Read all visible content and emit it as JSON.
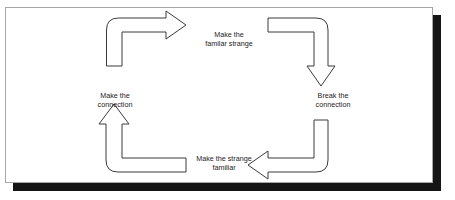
{
  "figure": {
    "top_caption": "",
    "panel": {
      "background_color": "#ffffff",
      "border_color": "#a7a7a7",
      "shadow_color": "#151515"
    }
  },
  "diagram": {
    "type": "cycle",
    "stroke_color": "#3a3a3a",
    "fill_color": "#ffffff",
    "direction": "clockwise",
    "stages": [
      {
        "id": "make-familiar-strange",
        "label": "Make the\nfamilar strange",
        "position": "top"
      },
      {
        "id": "break-connection",
        "label": "Break the\nconnection",
        "position": "right"
      },
      {
        "id": "make-strange-familiar",
        "label": "Make the strange\nfamiliar",
        "position": "bottom"
      },
      {
        "id": "make-connection",
        "label": "Make the\nconnection",
        "position": "left"
      }
    ],
    "arrows": [
      {
        "id": "arrow-top-left",
        "from": "make-connection",
        "to": "make-familiar-strange",
        "points": "right"
      },
      {
        "id": "arrow-top-right",
        "from": "make-familiar-strange",
        "to": "break-connection",
        "points": "down"
      },
      {
        "id": "arrow-bottom-right",
        "from": "break-connection",
        "to": "make-strange-familiar",
        "points": "left"
      },
      {
        "id": "arrow-bottom-left",
        "from": "make-strange-familiar",
        "to": "make-connection",
        "points": "up"
      }
    ]
  }
}
